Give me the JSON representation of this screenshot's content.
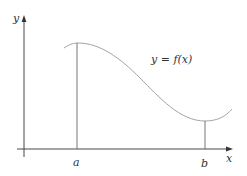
{
  "diagram": {
    "type": "function-graph",
    "axes": {
      "x_label": "x",
      "y_label": "y"
    },
    "curve": {
      "label": "y = f(x)",
      "stroke_color": "#9a9a9a"
    },
    "markers": [
      {
        "name": "a",
        "label": "a"
      },
      {
        "name": "b",
        "label": "b"
      }
    ],
    "colors": {
      "axis": "#333333",
      "guide": "#666666",
      "text": "#333333",
      "background": "#ffffff"
    }
  }
}
